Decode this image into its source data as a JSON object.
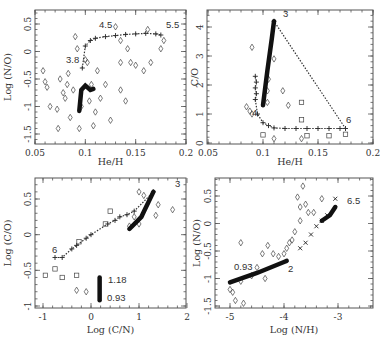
{
  "chart_data": [
    {
      "type": "scatter",
      "panel": "top-left",
      "xlabel": "He/H",
      "ylabel": "Log (N/O)",
      "xlim": [
        0.05,
        0.2
      ],
      "ylim": [
        -1.7,
        0.7
      ],
      "xticks": [
        "0.05",
        "0.1",
        "0.15",
        "0.2"
      ],
      "yticks": [
        "-1.5",
        "-1",
        "-0.5",
        "0",
        "0.5"
      ],
      "annotations": [
        "4.5",
        "5.5",
        "3.8"
      ],
      "series": [
        {
          "name": "models (+)",
          "marker": "plus",
          "points": [
            [
              0.097,
              -0.3
            ],
            [
              0.1,
              0.1
            ],
            [
              0.105,
              0.2
            ],
            [
              0.11,
              0.24
            ],
            [
              0.12,
              0.27
            ],
            [
              0.13,
              0.29
            ],
            [
              0.14,
              0.31
            ],
            [
              0.15,
              0.32
            ],
            [
              0.16,
              0.33
            ],
            [
              0.17,
              0.32
            ],
            [
              0.175,
              0.3
            ]
          ]
        },
        {
          "name": "observations (diamond)",
          "marker": "diamond",
          "points": [
            [
              0.06,
              -0.55
            ],
            [
              0.058,
              -0.35
            ],
            [
              0.062,
              -0.65
            ],
            [
              0.065,
              -1.0
            ],
            [
              0.072,
              -1.05
            ],
            [
              0.073,
              -1.4
            ],
            [
              0.075,
              -0.5
            ],
            [
              0.078,
              -0.75
            ],
            [
              0.08,
              -0.85
            ],
            [
              0.082,
              -0.6
            ],
            [
              0.083,
              -0.4
            ],
            [
              0.085,
              -1.2
            ],
            [
              0.088,
              -0.7
            ],
            [
              0.09,
              0.27
            ],
            [
              0.092,
              0.05
            ],
            [
              0.094,
              -1.4
            ],
            [
              0.096,
              -1.0
            ],
            [
              0.1,
              -0.15
            ],
            [
              0.102,
              -0.2
            ],
            [
              0.104,
              -0.9
            ],
            [
              0.106,
              -0.6
            ],
            [
              0.108,
              -1.35
            ],
            [
              0.11,
              -1.1
            ],
            [
              0.112,
              -0.35
            ],
            [
              0.115,
              -0.85
            ],
            [
              0.12,
              -0.6
            ],
            [
              0.125,
              -1.25
            ],
            [
              0.13,
              0.45
            ],
            [
              0.135,
              -0.2
            ],
            [
              0.135,
              0.2
            ],
            [
              0.135,
              -0.7
            ],
            [
              0.14,
              -0.9
            ],
            [
              0.142,
              0.05
            ],
            [
              0.145,
              -0.2
            ],
            [
              0.15,
              -0.25
            ],
            [
              0.158,
              -0.35
            ],
            [
              0.162,
              0.4
            ],
            [
              0.165,
              -0.2
            ],
            [
              0.175,
              0.05
            ],
            [
              0.178,
              0.2
            ]
          ]
        },
        {
          "name": "thick track",
          "marker": "line",
          "points": [
            [
              0.094,
              -1.08
            ],
            [
              0.096,
              -0.7
            ],
            [
              0.1,
              -0.62
            ],
            [
              0.105,
              -0.7
            ],
            [
              0.108,
              -0.68
            ]
          ]
        }
      ]
    },
    {
      "type": "scatter",
      "panel": "top-right",
      "xlabel": "He/H",
      "ylabel": "C/O",
      "xlim": [
        0.05,
        0.2
      ],
      "ylim": [
        0,
        4.5
      ],
      "xticks": [
        "0.05",
        "0.1",
        "0.15",
        "0.2"
      ],
      "yticks": [
        "0",
        "1",
        "2",
        "3",
        "4"
      ],
      "annotations": [
        "3",
        "6",
        "4"
      ],
      "series": [
        {
          "name": "models (+)",
          "marker": "plus",
          "points": [
            [
              0.093,
              2.3
            ],
            [
              0.094,
              2.1
            ],
            [
              0.093,
              1.9
            ],
            [
              0.094,
              1.7
            ],
            [
              0.093,
              1.5
            ],
            [
              0.095,
              1.0
            ],
            [
              0.1,
              0.7
            ],
            [
              0.105,
              0.6
            ],
            [
              0.11,
              0.52
            ],
            [
              0.12,
              0.5
            ],
            [
              0.13,
              0.5
            ],
            [
              0.14,
              0.5
            ],
            [
              0.15,
              0.5
            ],
            [
              0.16,
              0.5
            ],
            [
              0.17,
              0.5
            ],
            [
              0.175,
              0.5
            ],
            [
              0.11,
              4.2
            ]
          ]
        },
        {
          "name": "observations (diamond)",
          "marker": "diamond",
          "points": [
            [
              0.085,
              1.25
            ],
            [
              0.088,
              1.1
            ],
            [
              0.09,
              3.3
            ],
            [
              0.11,
              2.9
            ],
            [
              0.105,
              2.2
            ],
            [
              0.104,
              1.8
            ],
            [
              0.104,
              1.4
            ],
            [
              0.118,
              1.8
            ],
            [
              0.123,
              1.3
            ],
            [
              0.11,
              0.15
            ],
            [
              0.135,
              0.15
            ],
            [
              0.09,
              1.0
            ]
          ]
        },
        {
          "name": "observations (square)",
          "marker": "square",
          "points": [
            [
              0.1,
              0.28
            ],
            [
              0.135,
              1.4
            ],
            [
              0.135,
              0.8
            ],
            [
              0.14,
              0.25
            ],
            [
              0.16,
              0.25
            ],
            [
              0.175,
              0.3
            ]
          ]
        },
        {
          "name": "thick track",
          "marker": "line",
          "points": [
            [
              0.1,
              1.3
            ],
            [
              0.104,
              2.5
            ],
            [
              0.108,
              3.6
            ],
            [
              0.11,
              4.2
            ]
          ]
        }
      ]
    },
    {
      "type": "scatter",
      "panel": "bottom-left",
      "xlabel": "Log (C/N)",
      "ylabel": "Log (C/O)",
      "xlim": [
        -1.2,
        2
      ],
      "ylim": [
        -1,
        0.7
      ],
      "xticks": [
        "-1",
        "0",
        "1",
        "2"
      ],
      "yticks": [
        "-1",
        "-0.5",
        "0",
        "0.5"
      ],
      "annotations": [
        "3",
        "6",
        "1.18",
        "0.93"
      ],
      "series": [
        {
          "name": "models (+)",
          "marker": "plus",
          "points": [
            [
              -0.75,
              -0.32
            ],
            [
              -0.6,
              -0.32
            ],
            [
              -0.4,
              -0.2
            ],
            [
              -0.3,
              -0.15
            ],
            [
              -0.1,
              -0.05
            ],
            [
              0,
              0
            ],
            [
              0.35,
              0.15
            ],
            [
              0.5,
              0.2
            ],
            [
              0.6,
              0.25
            ],
            [
              0.75,
              0.28
            ],
            [
              0.9,
              0.33
            ],
            [
              1.3,
              0.6
            ]
          ]
        },
        {
          "name": "observations (diamond)",
          "marker": "diamond",
          "points": [
            [
              -0.3,
              -0.78
            ],
            [
              -0.1,
              -0.8
            ],
            [
              0.8,
              0.12
            ],
            [
              0.9,
              0.25
            ],
            [
              1.0,
              0.15
            ],
            [
              1.0,
              0.6
            ],
            [
              1.4,
              0.42
            ],
            [
              1.35,
              0.27
            ],
            [
              1.7,
              0.35
            ],
            [
              1.1,
              0.55
            ]
          ]
        },
        {
          "name": "observations (square)",
          "marker": "square",
          "points": [
            [
              -0.95,
              -0.57
            ],
            [
              -0.75,
              -0.48
            ],
            [
              -0.6,
              -0.6
            ],
            [
              -0.3,
              -0.57
            ],
            [
              -0.25,
              -0.1
            ],
            [
              0.3,
              0.15
            ],
            [
              0.4,
              0.33
            ]
          ]
        },
        {
          "name": "thick track",
          "marker": "line",
          "points": [
            [
              0.8,
              0.08
            ],
            [
              1.05,
              0.25
            ],
            [
              1.1,
              0.32
            ],
            [
              1.3,
              0.6
            ]
          ]
        },
        {
          "name": "vertical bar",
          "marker": "line",
          "points": [
            [
              0.18,
              -0.6
            ],
            [
              0.18,
              -0.92
            ]
          ]
        }
      ]
    },
    {
      "type": "scatter",
      "panel": "bottom-right",
      "xlabel": "Log (N/H)",
      "ylabel": "Log (N/O)",
      "xlim": [
        -5.3,
        -2.5
      ],
      "ylim": [
        -1.7,
        0.8
      ],
      "xticks": [
        "-5",
        "-4",
        "-3"
      ],
      "yticks": [
        "-1.5",
        "-1",
        "-0.5",
        "0",
        "0.5"
      ],
      "annotations": [
        "0.93",
        "2",
        "6.5"
      ],
      "series": [
        {
          "name": "models (x/+)",
          "marker": "cross",
          "points": [
            [
              -3.7,
              -0.45
            ],
            [
              -3.6,
              -0.35
            ],
            [
              -3.5,
              -0.2
            ],
            [
              -3.4,
              -0.05
            ],
            [
              -3.3,
              0.05
            ],
            [
              -3.2,
              0.15
            ],
            [
              -3.05,
              0.45
            ]
          ]
        },
        {
          "name": "observations (diamond)",
          "marker": "diamond",
          "points": [
            [
              -5.0,
              -1.2
            ],
            [
              -4.95,
              -1.25
            ],
            [
              -4.9,
              -1.4
            ],
            [
              -4.8,
              -0.35
            ],
            [
              -4.8,
              -1.05
            ],
            [
              -4.75,
              -1.45
            ],
            [
              -4.6,
              -0.95
            ],
            [
              -4.5,
              -0.8
            ],
            [
              -4.4,
              -0.55
            ],
            [
              -4.35,
              -1.0
            ],
            [
              -4.3,
              -0.4
            ],
            [
              -4.2,
              -0.55
            ],
            [
              -4.1,
              -0.6
            ],
            [
              -4.0,
              -0.55
            ],
            [
              -3.95,
              -0.45
            ],
            [
              -3.9,
              -0.35
            ],
            [
              -3.85,
              -0.3
            ],
            [
              -3.8,
              -0.15
            ],
            [
              -3.75,
              0.48
            ],
            [
              -3.7,
              0.3
            ],
            [
              -3.7,
              0.05
            ],
            [
              -3.65,
              0.68
            ],
            [
              -3.6,
              0.35
            ],
            [
              -3.55,
              0.2
            ],
            [
              -3.45,
              0.2
            ],
            [
              -3.3,
              0.45
            ]
          ]
        },
        {
          "name": "thick track",
          "marker": "line",
          "points": [
            [
              -5.0,
              -1.07
            ],
            [
              -4.5,
              -0.9
            ],
            [
              -4.0,
              -0.7
            ],
            [
              -3.95,
              -0.68
            ]
          ]
        },
        {
          "name": "thick track upper",
          "marker": "line",
          "points": [
            [
              -3.3,
              0.05
            ],
            [
              -3.15,
              0.15
            ],
            [
              -3.05,
              0.3
            ]
          ]
        }
      ]
    }
  ]
}
